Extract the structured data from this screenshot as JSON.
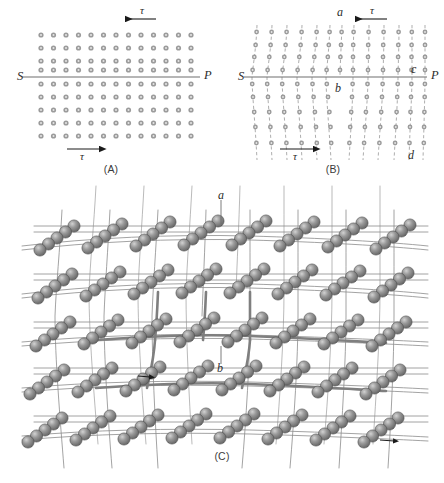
{
  "figure": {
    "panels": [
      {
        "id": "A",
        "caption": "(A)",
        "description": "Perfect square lattice of atoms with slip plane SP and applied shear stress tau",
        "labels": {
          "left_endpoint": "S",
          "right_endpoint": "P",
          "tau_top": "τ",
          "tau_bottom": "τ"
        },
        "lattice": {
          "columns": 13,
          "rows": 9,
          "dot_color": "#9b9b9b"
        },
        "arrows": [
          {
            "name": "tau-top-arrow",
            "direction": "left"
          },
          {
            "name": "tau-bottom-arrow",
            "direction": "right"
          }
        ]
      },
      {
        "id": "B",
        "caption": "(B)",
        "description": "Sheared lattice showing extra half plane ab and slip plane SP with points c and d",
        "labels": {
          "left_endpoint": "S",
          "right_endpoint": "P",
          "tau_top": "τ",
          "tau_bottom": "τ",
          "point_a": "a",
          "point_b": "b",
          "point_c": "c",
          "point_d": "d"
        },
        "lattice": {
          "columns": 13,
          "rows": 9,
          "dot_color": "#9b9b9b"
        },
        "arrows": [
          {
            "name": "tau-top-arrow",
            "direction": "left"
          },
          {
            "name": "tau-bottom-arrow",
            "direction": "right"
          }
        ]
      },
      {
        "id": "C",
        "caption": "(C)",
        "description": "Three dimensional ball and stick crystal lattice showing the edge dislocation line ab",
        "labels": {
          "point_a": "a",
          "point_b": "b"
        },
        "atom_color": "#7d7d7d",
        "bond_color": "#8c8c8c"
      }
    ]
  },
  "colors": {
    "dot": "#9b9b9b",
    "line": "#6e6e6e",
    "arrow": "#1a1a1a",
    "atom_fill": "#7d7d7d",
    "atom_highlight": "#c9c9c9",
    "bond": "#909090",
    "text": "#2b2b2b"
  }
}
